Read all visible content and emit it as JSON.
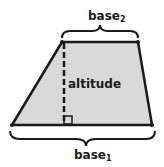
{
  "diagram": {
    "type": "trapezoid",
    "fill_color": "#d9d9d9",
    "stroke_color": "#1a1a1a",
    "labels": {
      "top_base": {
        "text": "base",
        "subscript": "2"
      },
      "bottom_base": {
        "text": "base",
        "subscript": "1"
      },
      "altitude": "altitude"
    },
    "vertices": {
      "top_left": [
        62,
        42
      ],
      "top_right": [
        138,
        42
      ],
      "bottom_right": [
        152,
        125
      ],
      "bottom_left": [
        12,
        125
      ]
    },
    "annotations": [
      "right-angle marker at altitude foot",
      "curly brace over base2",
      "curly brace under base1",
      "dashed altitude line"
    ]
  }
}
